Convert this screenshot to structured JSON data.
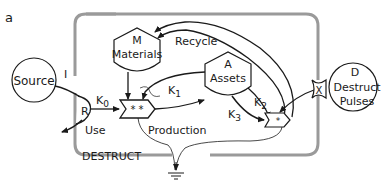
{
  "panel_label": "a",
  "boundary": {
    "label": "DESTRUCT",
    "style": "gray dashed rounded rectangle"
  },
  "nodes": {
    "source": {
      "label": "Source",
      "shape": "circle"
    },
    "materials": {
      "letter": "M",
      "label": "Materials",
      "shape": "tank"
    },
    "assets": {
      "letter": "A",
      "label": "Assets",
      "shape": "tank"
    },
    "destruct_pulses": {
      "letter": "D",
      "label1": "Destruct",
      "label2": "Pulses",
      "shape": "circle"
    },
    "production": {
      "symbol": "* *",
      "label": "Production",
      "shape": "workgate"
    },
    "destruct_gate": {
      "symbol": "*",
      "shape": "workgate"
    },
    "x_gate": {
      "letter": "X",
      "shape": "pulse-interaction"
    },
    "r_node": {
      "letter": "R"
    },
    "i_label": "I"
  },
  "flows": {
    "k0": {
      "base": "K",
      "sub": "0"
    },
    "k1": {
      "base": "K",
      "sub": "1"
    },
    "k2": {
      "base": "K",
      "sub": "2"
    },
    "k3": {
      "base": "K",
      "sub": "3"
    },
    "recycle": "Recycle",
    "use": "Use"
  },
  "colors": {
    "line": "#1a1a1a",
    "boundary": "#9a9a9a",
    "background": "#ffffff"
  }
}
